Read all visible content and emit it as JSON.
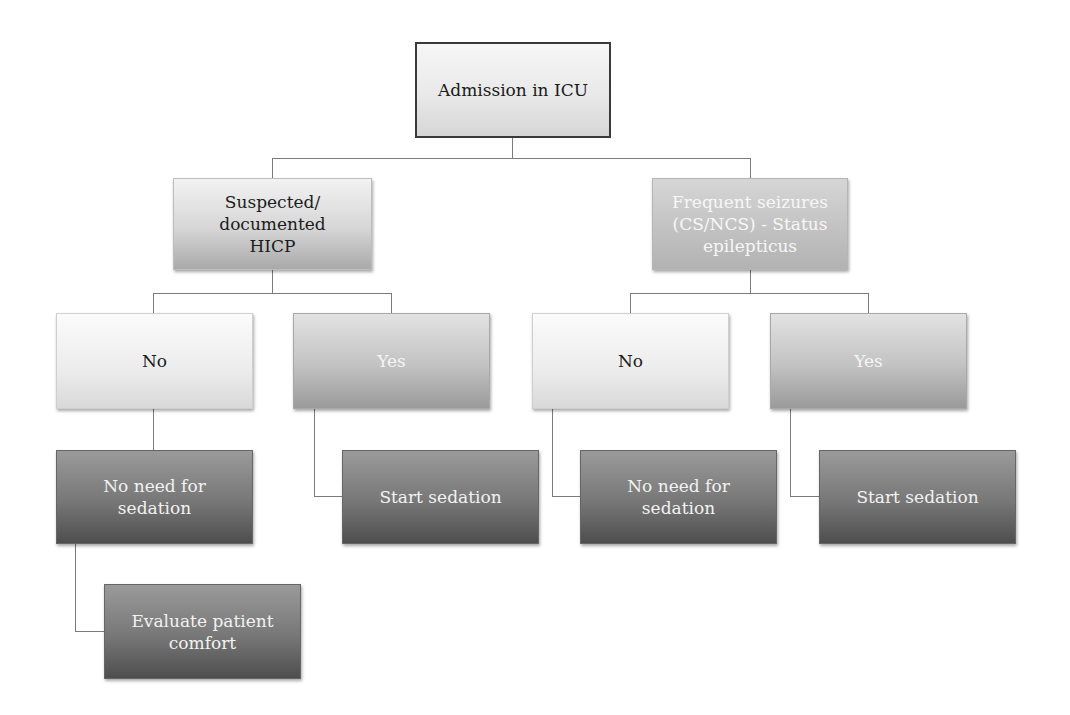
{
  "diagram": {
    "type": "flowchart",
    "root": {
      "label": "Admission in ICU"
    },
    "level2": [
      {
        "label": "Suspected/ documented HICP"
      },
      {
        "label": "Frequent seizures (CS/NCS) - Status epilepticus"
      }
    ],
    "level3": [
      {
        "label": "No"
      },
      {
        "label": "Yes"
      },
      {
        "label": "No"
      },
      {
        "label": "Yes"
      }
    ],
    "level4": [
      {
        "label": "No need for sedation"
      },
      {
        "label": "Start sedation"
      },
      {
        "label": "No need for sedation"
      },
      {
        "label": "Start sedation"
      }
    ],
    "level5": [
      {
        "label": "Evaluate patient comfort"
      }
    ],
    "colors": {
      "connector": "#7b7b7b",
      "root_border": "#3a3a3a",
      "light_fill": "#ececec",
      "mid_fill": "#c2c2c2",
      "dark_fill": "#777777"
    }
  }
}
